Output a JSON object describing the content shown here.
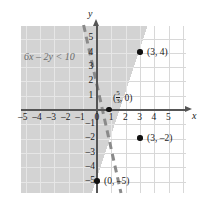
{
  "chart_data": {
    "type": "line",
    "title": "",
    "subtitle": "",
    "xlabel": "x",
    "ylabel": "y",
    "xlim": [
      -5.8,
      5.8
    ],
    "ylim": [
      -5.8,
      5.8
    ],
    "grid": true,
    "legend": null,
    "inequality": "6x – 2y < 10",
    "inequality_parts": {
      "lhs": "6x – 2y",
      "operator": "<",
      "rhs": "10"
    },
    "boundary_line": {
      "equation": "6x – 2y = 10",
      "slope": 3,
      "y_intercept": -5,
      "x_intercept": "5/3",
      "style": "dashed",
      "color": "#8a8a8a",
      "strict": true
    },
    "shaded_region": {
      "side": "upper-left",
      "description": "6x – 2y < 10",
      "color": "#d3d3d3"
    },
    "x_ticks": [
      -5,
      -4,
      -3,
      -2,
      -1,
      0,
      1,
      2,
      3,
      4,
      5
    ],
    "y_ticks": [
      5,
      4,
      3,
      2,
      1,
      -1,
      -2,
      -3,
      -4,
      -5
    ],
    "x_tick_labels": [
      "–5",
      "–4",
      "–3",
      "–2",
      "–1",
      "0",
      "1",
      "2",
      "3",
      "4",
      "5"
    ],
    "y_tick_labels": [
      "5",
      "4",
      "3",
      "2",
      "1",
      "–1",
      "–2",
      "–3",
      "–4",
      "–5"
    ],
    "points": [
      {
        "label": "(3, 4)",
        "x": 3,
        "y": 4,
        "on_boundary": true,
        "filled": true
      },
      {
        "label": "(3, –2)",
        "x": 3,
        "y": -2,
        "on_boundary": false,
        "filled": true
      },
      {
        "label": "(0, –5)",
        "x": 0,
        "y": -5,
        "on_boundary": true,
        "filled": true
      }
    ],
    "intercept_label": {
      "numerator": "5",
      "denominator": "3",
      "prefix": "(",
      "suffix": ", 0)",
      "x": 1.6667,
      "y": 0
    }
  },
  "axes": {
    "x_axis_label": "x",
    "y_axis_label": "y"
  },
  "labels": {
    "point_3_4": "(3, 4)",
    "point_3_neg2": "(3, –2)",
    "point_0_neg5": "(0, –5)",
    "intercept_open": "(",
    "intercept_close": ", 0)",
    "intercept_num": "5",
    "intercept_den": "3"
  }
}
